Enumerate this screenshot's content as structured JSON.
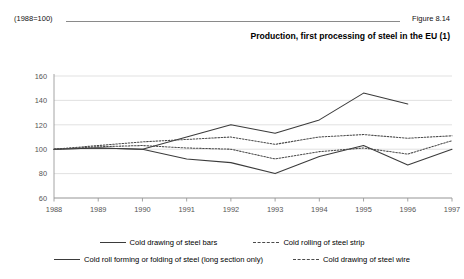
{
  "header": {
    "index_note": "(1988=100)",
    "figure_label": "Figure 8.14"
  },
  "title": "Production, first processing of steel in the EU (1)",
  "legend": {
    "row1": [
      {
        "label": "Cold drawing of steel bars",
        "style": "solid"
      },
      {
        "label": "Cold rolling of steel strip",
        "style": "dashed"
      }
    ],
    "row2": [
      {
        "label": "Cold roll forming or folding of steel (long section only)",
        "style": "solid"
      },
      {
        "label": "Cold drawing of steel wire",
        "style": "dashed"
      }
    ]
  },
  "chart_data": {
    "type": "line",
    "title": "Production, first processing of steel in the EU (1)",
    "xlabel": "",
    "ylabel": "",
    "ylim": [
      60,
      160
    ],
    "ytick_step": 20,
    "yticks": [
      60,
      80,
      100,
      120,
      140,
      160
    ],
    "x": [
      1988,
      1989,
      1990,
      1991,
      1992,
      1993,
      1994,
      1995,
      1996,
      1997
    ],
    "xticks": [
      "1988",
      "1989",
      "1990",
      "1991",
      "1992",
      "1993",
      "1994",
      "1995",
      "1996",
      "1997"
    ],
    "grid": true,
    "grid_axis": "y",
    "legend_position": "bottom",
    "series": [
      {
        "name": "Cold drawing of steel bars",
        "style": "solid",
        "color": "#3b3b3b",
        "values": [
          100,
          101,
          100,
          110,
          120,
          113,
          124,
          146,
          137,
          null
        ]
      },
      {
        "name": "Cold rolling of steel strip",
        "style": "dashed",
        "color": "#4a4a4a",
        "values": [
          100,
          103,
          106,
          108,
          110,
          104,
          110,
          112,
          109,
          111
        ]
      },
      {
        "name": "Cold roll forming or folding of steel (long section only)",
        "style": "solid",
        "color": "#3b3b3b",
        "values": [
          100,
          101,
          100,
          92,
          89,
          80,
          94,
          103,
          87,
          100
        ]
      },
      {
        "name": "Cold drawing of steel wire",
        "style": "dashed",
        "color": "#4a4a4a",
        "values": [
          100,
          102,
          103,
          101,
          100,
          92,
          98,
          101,
          96,
          107
        ]
      }
    ]
  }
}
